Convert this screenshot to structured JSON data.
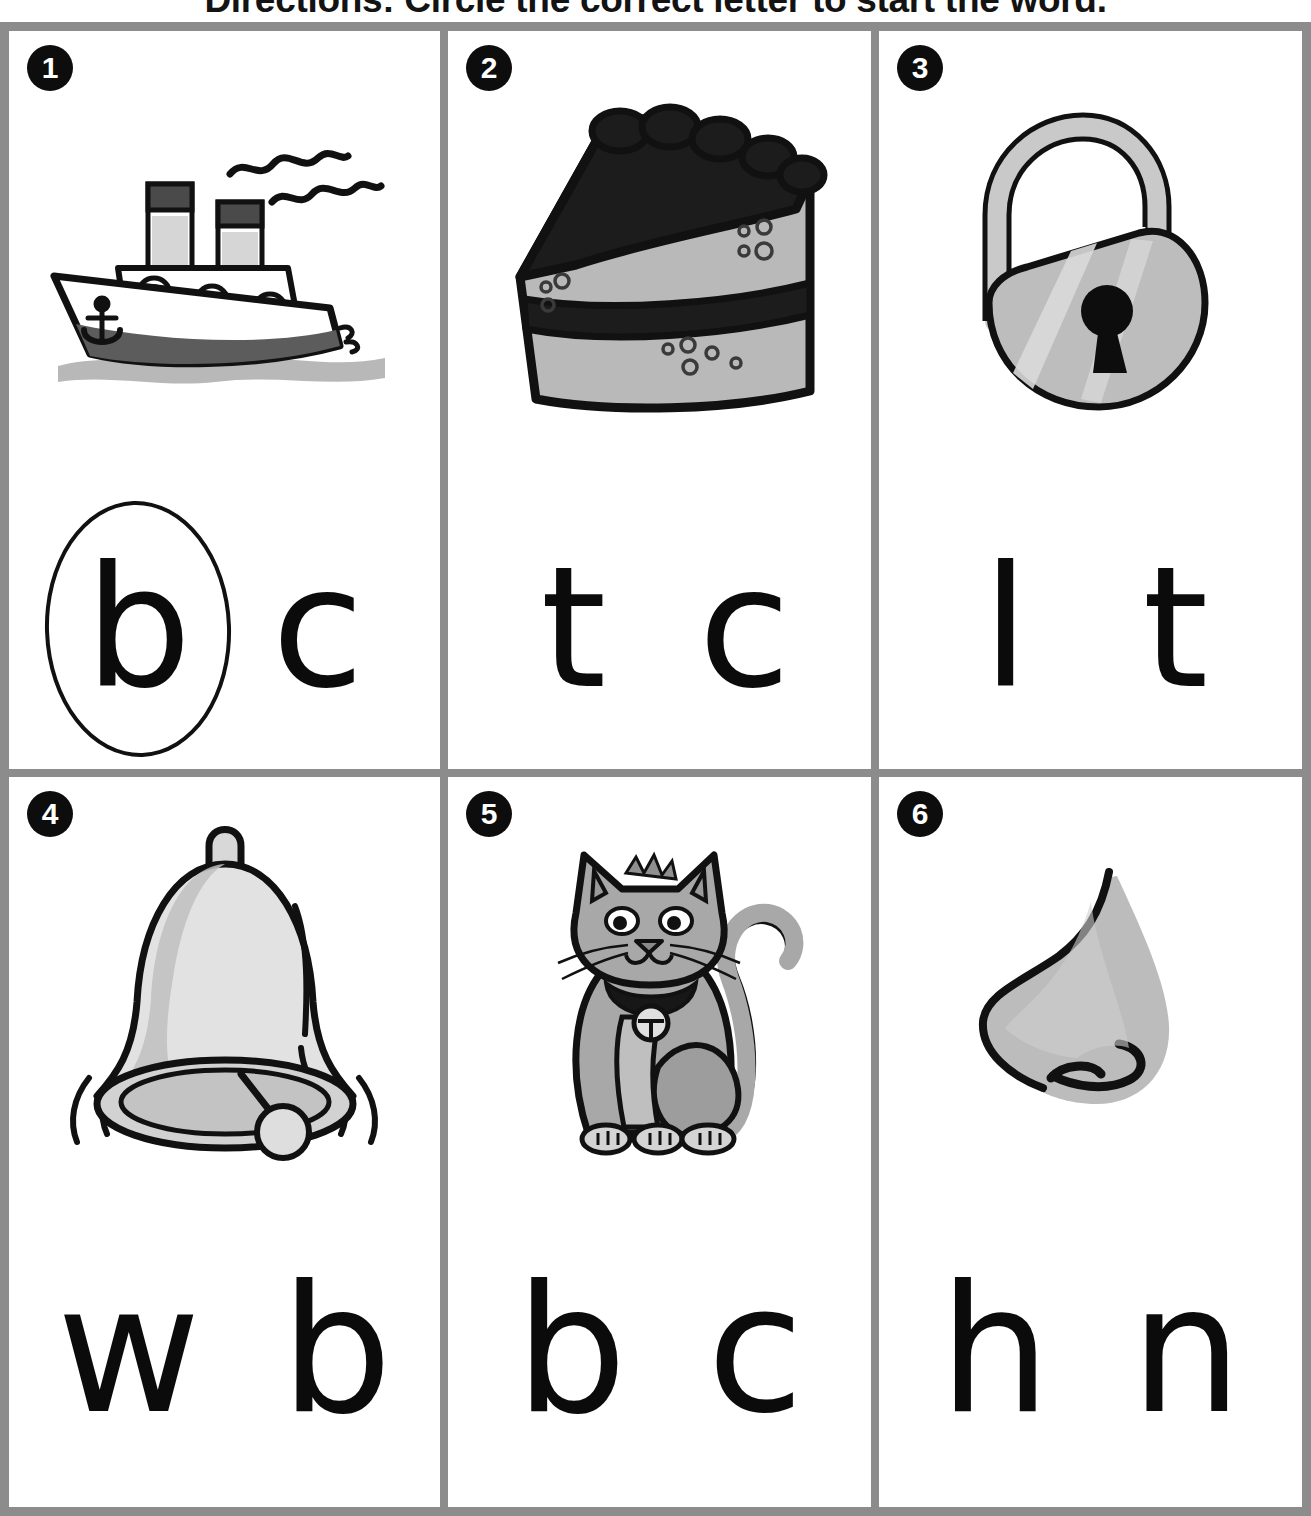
{
  "worksheet": {
    "directions": "Directions: Circle the correct letter to start the word.",
    "border_color": "#8c8c8c",
    "ink_color": "#0b0b0b",
    "items": [
      {
        "number": "1",
        "picture": "boat-illustration",
        "picture_label": "boat",
        "choices": [
          {
            "letter": "b",
            "circled": true
          },
          {
            "letter": "c",
            "circled": false
          }
        ]
      },
      {
        "number": "2",
        "picture": "cake-slice-illustration",
        "picture_label": "cake",
        "choices": [
          {
            "letter": "t",
            "circled": false
          },
          {
            "letter": "c",
            "circled": false
          }
        ]
      },
      {
        "number": "3",
        "picture": "padlock-illustration",
        "picture_label": "lock",
        "choices": [
          {
            "letter": "l",
            "circled": false
          },
          {
            "letter": "t",
            "circled": false
          }
        ]
      },
      {
        "number": "4",
        "picture": "bell-illustration",
        "picture_label": "bell",
        "choices": [
          {
            "letter": "w",
            "circled": false
          },
          {
            "letter": "b",
            "circled": false
          }
        ]
      },
      {
        "number": "5",
        "picture": "cat-illustration",
        "picture_label": "cat",
        "choices": [
          {
            "letter": "b",
            "circled": false
          },
          {
            "letter": "c",
            "circled": false
          }
        ]
      },
      {
        "number": "6",
        "picture": "nose-illustration",
        "picture_label": "nose",
        "choices": [
          {
            "letter": "h",
            "circled": false
          },
          {
            "letter": "n",
            "circled": false
          }
        ]
      }
    ]
  }
}
